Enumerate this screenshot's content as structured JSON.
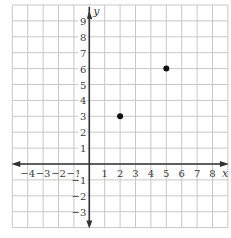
{
  "chart_data": {
    "type": "scatter",
    "title": "",
    "xlabel": "x",
    "ylabel": "y",
    "xlim": [
      -5,
      9
    ],
    "ylim": [
      -4,
      10
    ],
    "grid": true,
    "legend": null,
    "x_tick_labels": [
      "−4",
      "−3",
      "−2",
      "−1",
      "1",
      "2",
      "3",
      "4",
      "5",
      "6",
      "7",
      "8"
    ],
    "x_ticks": [
      -4,
      -3,
      -2,
      -1,
      1,
      2,
      3,
      4,
      5,
      6,
      7,
      8
    ],
    "y_tick_labels": [
      "9",
      "8",
      "7",
      "6",
      "5",
      "4",
      "3",
      "2",
      "1",
      "−1",
      "−2",
      "−3"
    ],
    "y_ticks": [
      9,
      8,
      7,
      6,
      5,
      4,
      3,
      2,
      1,
      -1,
      -2,
      -3
    ],
    "points": [
      {
        "x": 2,
        "y": 3
      },
      {
        "x": 5,
        "y": 6
      }
    ],
    "colors": {
      "grid": "#c8c8c8",
      "axis": "#333333",
      "point": "#111111"
    }
  },
  "labels": {
    "x_axis": "x",
    "y_axis": "y"
  }
}
